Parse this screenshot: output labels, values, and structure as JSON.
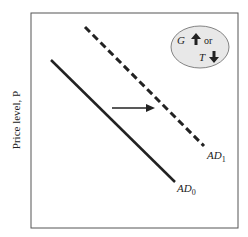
{
  "diagram": {
    "y_axis_label": "Price level, P",
    "curves": [
      {
        "name": "AD",
        "subscript": "0",
        "style": "solid"
      },
      {
        "name": "AD",
        "subscript": "1",
        "style": "dashed"
      }
    ],
    "shift_arrow": "right",
    "callout": {
      "line1_var": "G",
      "line1_dir": "up",
      "connector": "or",
      "line2_var": "T",
      "line2_dir": "down"
    },
    "colors": {
      "line": "#222222",
      "frame": "#555555",
      "callout_fill": "#e8e8e8"
    }
  }
}
